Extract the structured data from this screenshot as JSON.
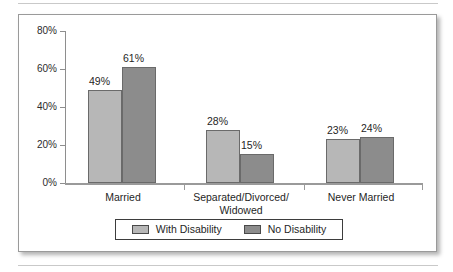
{
  "chart_data": {
    "type": "bar",
    "title": "",
    "xlabel": "",
    "ylabel": "",
    "ylim": [
      0,
      80
    ],
    "grid": false,
    "legend_position": "bottom",
    "categories": [
      "Married",
      "Separated/Divorced/\nWidowed",
      "Never Married"
    ],
    "category_lines": [
      [
        "Married"
      ],
      [
        "Separated/Divorced/",
        "Widowed"
      ],
      [
        "Never Married"
      ]
    ],
    "y_ticks": [
      {
        "value": 0,
        "label": "0%"
      },
      {
        "value": 20,
        "label": "20%"
      },
      {
        "value": 40,
        "label": "40%"
      },
      {
        "value": 60,
        "label": "60%"
      },
      {
        "value": 80,
        "label": "80%"
      }
    ],
    "series": [
      {
        "name": "With Disability",
        "color": "#b7b7b7",
        "values": [
          49,
          28,
          23
        ],
        "labels": [
          "49%",
          "28%",
          "23%"
        ]
      },
      {
        "name": "No Disability",
        "color": "#8c8c8c",
        "values": [
          61,
          15,
          24
        ],
        "labels": [
          "61%",
          "15%",
          "24%"
        ]
      }
    ],
    "legend": [
      {
        "label": "With Disability",
        "swatch": "light"
      },
      {
        "label": "No Disability",
        "swatch": "dark"
      }
    ]
  }
}
